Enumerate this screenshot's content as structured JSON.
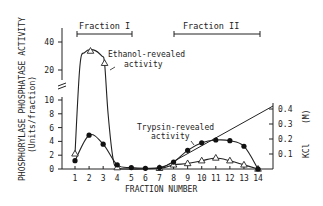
{
  "chart_data": {
    "type": "line",
    "title": "",
    "xlabel": "FRACTION NUMBER",
    "ylabel": "PHOSPHORYLASE PHOSPHATASE ACTIVITY",
    "ylabel_units": "(Units/fraction)",
    "y2label": "KCl (M)",
    "x": [
      1,
      2,
      3,
      4,
      5,
      6,
      7,
      8,
      9,
      10,
      11,
      12,
      13,
      14
    ],
    "xticks": [
      "1",
      "2",
      "3",
      "4",
      "5",
      "6",
      "7",
      "8",
      "9",
      "10",
      "11",
      "12",
      "13",
      "14"
    ],
    "yticks_lower": [
      "0",
      "2",
      "4",
      "6",
      "8",
      "10"
    ],
    "yticks_upper": [
      "20",
      "40"
    ],
    "y2ticks": [
      "0.1",
      "0.2",
      "0.3",
      "0.4"
    ],
    "axis_break": true,
    "series": [
      {
        "name": "Ethanol-revealed activity",
        "marker": "open-triangle",
        "x": [
          1,
          2.1,
          3.1,
          4,
          5,
          6,
          7,
          8,
          9,
          10,
          11,
          12,
          13,
          14
        ],
        "values": [
          2.2,
          37,
          27,
          0.2,
          0,
          0,
          0.1,
          0.6,
          0.8,
          1.2,
          1.6,
          1.2,
          0.6,
          0
        ]
      },
      {
        "name": "Trypsin-revealed activity",
        "marker": "filled-circle",
        "x": [
          1,
          2,
          3,
          4,
          5,
          6,
          7,
          8,
          9,
          10,
          11,
          12,
          13,
          14
        ],
        "values": [
          1.2,
          4.9,
          3.6,
          0.6,
          0.2,
          0.1,
          0.2,
          1.0,
          2.7,
          3.8,
          4.2,
          4.1,
          3.3,
          0
        ]
      },
      {
        "name": "KCl gradient",
        "marker": "none",
        "axis": "right",
        "x": [
          7,
          15
        ],
        "values": [
          0,
          0.44
        ]
      }
    ],
    "annotations": [
      {
        "text": "Fraction I",
        "range": [
          1.5,
          5
        ]
      },
      {
        "text": "Fraction II",
        "range": [
          8,
          14
        ]
      },
      {
        "text": "Ethanol-revealed activity"
      },
      {
        "text": "Trypsin-revealed activity"
      }
    ],
    "ylim_lower": [
      0,
      10
    ],
    "ylim_upper": [
      10,
      45
    ],
    "y2lim": [
      0,
      0.45
    ]
  },
  "labels": {
    "fraction1": "Fraction I",
    "fraction2": "Fraction II",
    "ethanol_line1": "Ethanol-revealed",
    "ethanol_line2": "activity",
    "trypsin_line1": "Trypsin-revealed",
    "trypsin_line2": "activity",
    "xlabel": "FRACTION NUMBER",
    "ylabel": "PHOSPHORYLASE PHOSPHATASE ACTIVITY",
    "ylabel_units": "(Units/fraction)",
    "y2label_a": "KCl",
    "y2label_b": "(M)"
  }
}
